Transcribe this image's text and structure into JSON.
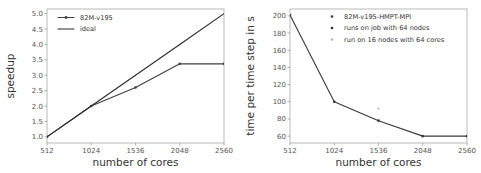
{
  "figure": {
    "background_color": "#ffffff",
    "panel_count": 2
  },
  "chart_data": [
    {
      "id": "speedup-chart",
      "type": "line",
      "title": "",
      "xlabel": "number of cores",
      "ylabel": "speedup",
      "x": [
        512,
        1024,
        1536,
        2048,
        2560
      ],
      "xticklabels": [
        "512",
        "1024",
        "1536",
        "2048",
        "2560"
      ],
      "xlim": [
        512,
        2560
      ],
      "ylim": [
        0.8,
        5.15
      ],
      "yticks": [
        1.0,
        1.5,
        2.0,
        2.5,
        3.0,
        3.5,
        4.0,
        4.5,
        5.0
      ],
      "yticklabels": [
        "1.0",
        "1.5",
        "2.0",
        "2.5",
        "3.0",
        "3.5",
        "4.0",
        "4.5",
        "5.0"
      ],
      "grid": false,
      "legend_position": "upper left",
      "series": [
        {
          "name": "82M-v195",
          "values": [
            1.0,
            2.0,
            2.6,
            3.37,
            3.37
          ],
          "color": "#404040",
          "marker": "line-marker",
          "linewidth": 1.1
        },
        {
          "name": "ideal",
          "values": [
            1.0,
            2.0,
            3.0,
            4.0,
            5.0
          ],
          "color": "#2b2b2b",
          "marker": "none",
          "linewidth": 1.1
        }
      ]
    },
    {
      "id": "time-per-step-chart",
      "type": "line",
      "title": "",
      "xlabel": "number of cores",
      "ylabel": "time per time step in s",
      "x": [
        512,
        1024,
        1536,
        2048,
        2560
      ],
      "xticklabels": [
        "512",
        "1024",
        "1536",
        "2048",
        "2560"
      ],
      "xlim": [
        512,
        2560
      ],
      "ylim": [
        52,
        208
      ],
      "yticks": [
        60,
        80,
        100,
        120,
        140,
        160,
        180,
        200
      ],
      "yticklabels": [
        "60",
        "80",
        "100",
        "120",
        "140",
        "160",
        "180",
        "200"
      ],
      "grid": false,
      "legend_position": "upper right",
      "series": [
        {
          "name": "82M-v195-HMPT-MPI",
          "values": [
            201,
            100,
            78,
            60,
            60
          ],
          "color": "#3a3a3a",
          "marker": "dot",
          "linewidth": 1.1
        },
        {
          "name": "runs on job with 64 nodes",
          "values": [],
          "color": "#2b2b2b",
          "marker": "dot",
          "linewidth": 0
        },
        {
          "name": "run on 16 nodes with 64 cores",
          "values": [],
          "color": "#b5b5b5",
          "marker": "dot",
          "linewidth": 0
        }
      ],
      "extra_points": [
        {
          "x": 1536,
          "y": 92,
          "color": "#bdbdbd",
          "label": "run on 16 nodes with 64 cores"
        }
      ]
    }
  ]
}
